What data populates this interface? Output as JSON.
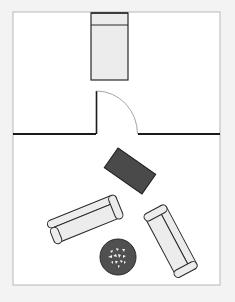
{
  "diagram": {
    "type": "floor-plan",
    "page_background": "#f3f3f3",
    "frame": {
      "x": 13,
      "y": 12,
      "width": 207,
      "height": 273,
      "fill": "#ffffff",
      "stroke": "#b8b8b8"
    },
    "colors": {
      "wall": "#1a1a1a",
      "furniture_fill": "#ececec",
      "furniture_stroke": "#2a2a2a",
      "table_fill": "#4a4a4a",
      "rug_fill": "#505050",
      "rug_pattern": "#f0f0f0",
      "door_arc": "#9a9a9a"
    },
    "rooms": [
      {
        "name": "Bedroom",
        "position": "top"
      },
      {
        "name": "Living Room",
        "position": "bottom"
      }
    ],
    "elements": {
      "bed": {
        "x": 91,
        "y": 13,
        "width": 37,
        "height": 67,
        "header_y": 25
      },
      "wall": {
        "y": 134,
        "left_start": 13,
        "left_end": 96,
        "right_start": 138,
        "right_end": 220
      },
      "door": {
        "hinge_x": 96,
        "top_y": 91,
        "bottom_y": 134,
        "arc_end_x": 137
      },
      "coffee_table": {
        "cx": 130,
        "cy": 171,
        "width": 46,
        "height": 24,
        "rotation": 35
      },
      "sofa_left": {
        "cx": 85,
        "cy": 219,
        "width": 74,
        "height": 24,
        "rotation": -22
      },
      "sofa_right": {
        "cx": 171,
        "cy": 241,
        "width": 72,
        "height": 24,
        "rotation": 62
      },
      "rug": {
        "cx": 118,
        "cy": 257,
        "r": 18
      }
    }
  }
}
